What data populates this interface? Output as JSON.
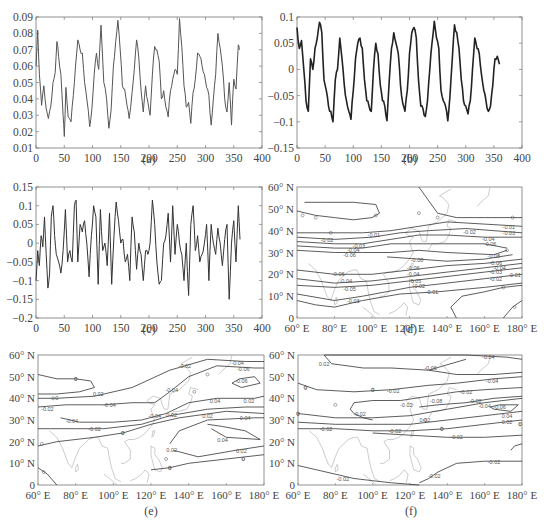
{
  "figure": {
    "panels": [
      "(a)",
      "(b)",
      "(c)",
      "(d)",
      "(e)",
      "(f)"
    ]
  },
  "chart_data": [
    {
      "id": "a",
      "type": "line",
      "caption": "(a)",
      "xlabel": "",
      "ylabel": "",
      "xlim": [
        0,
        400
      ],
      "ylim": [
        0.01,
        0.09
      ],
      "xticks": [
        0,
        50,
        100,
        150,
        200,
        250,
        300,
        350,
        400
      ],
      "yticks": [
        0.01,
        0.02,
        0.03,
        0.04,
        0.05,
        0.06,
        0.07,
        0.08,
        0.09
      ],
      "ytick_labels": [
        "0.01",
        "0.02",
        "0.03",
        "0.04",
        "0.05",
        "0.06",
        "0.07",
        "0.08",
        "0.09"
      ],
      "series": [
        {
          "name": "a",
          "color": "#555555",
          "x": [
            0,
            3,
            6,
            10,
            14,
            18,
            22,
            26,
            30,
            34,
            37,
            40,
            44,
            48,
            50,
            53,
            57,
            62,
            66,
            70,
            74,
            78,
            82,
            86,
            90,
            95,
            99,
            103,
            107,
            111,
            115,
            120,
            125,
            129,
            133,
            137,
            141,
            145,
            149,
            153,
            157,
            161,
            165,
            170,
            174,
            178,
            182,
            186,
            190,
            194,
            198,
            202,
            206,
            210,
            214,
            218,
            222,
            226,
            230,
            234,
            238,
            242,
            246,
            250,
            254,
            258,
            262,
            266,
            270,
            274,
            278,
            282,
            286,
            290,
            294,
            298,
            302,
            306,
            310,
            314,
            318,
            322,
            326,
            330,
            334,
            338,
            342,
            346,
            350,
            354,
            358,
            360
          ],
          "y": [
            0.06,
            0.082,
            0.055,
            0.036,
            0.048,
            0.034,
            0.028,
            0.035,
            0.05,
            0.056,
            0.075,
            0.066,
            0.055,
            0.03,
            0.017,
            0.047,
            0.029,
            0.026,
            0.042,
            0.06,
            0.076,
            0.07,
            0.068,
            0.05,
            0.04,
            0.023,
            0.034,
            0.055,
            0.068,
            0.058,
            0.085,
            0.05,
            0.04,
            0.022,
            0.033,
            0.06,
            0.075,
            0.088,
            0.07,
            0.048,
            0.046,
            0.036,
            0.028,
            0.044,
            0.058,
            0.076,
            0.065,
            0.045,
            0.032,
            0.048,
            0.038,
            0.03,
            0.055,
            0.072,
            0.07,
            0.063,
            0.04,
            0.045,
            0.035,
            0.029,
            0.045,
            0.052,
            0.058,
            0.055,
            0.089,
            0.072,
            0.048,
            0.035,
            0.038,
            0.025,
            0.044,
            0.052,
            0.068,
            0.066,
            0.06,
            0.055,
            0.047,
            0.042,
            0.024,
            0.04,
            0.055,
            0.08,
            0.071,
            0.06,
            0.04,
            0.032,
            0.05,
            0.024,
            0.052,
            0.046,
            0.073,
            0.07
          ]
        }
      ]
    },
    {
      "id": "b",
      "type": "line",
      "caption": "(b)",
      "xlabel": "",
      "ylabel": "",
      "xlim": [
        0,
        400
      ],
      "ylim": [
        -0.15,
        0.1
      ],
      "xticks": [
        0,
        50,
        100,
        150,
        200,
        250,
        300,
        350,
        400
      ],
      "yticks": [
        -0.15,
        -0.1,
        -0.05,
        0,
        0.05,
        0.1
      ],
      "ytick_labels": [
        "-0.15",
        "-0.1",
        "-0.05",
        "0",
        "0.05",
        "0.1"
      ],
      "series": [
        {
          "name": "b",
          "color": "#222222",
          "x": [
            0,
            4,
            8,
            12,
            16,
            20,
            24,
            28,
            32,
            36,
            40,
            44,
            48,
            52,
            56,
            60,
            64,
            68,
            72,
            76,
            80,
            84,
            88,
            92,
            96,
            100,
            104,
            108,
            112,
            116,
            120,
            124,
            128,
            132,
            136,
            140,
            144,
            148,
            152,
            156,
            160,
            164,
            168,
            172,
            176,
            180,
            184,
            188,
            192,
            196,
            200,
            204,
            208,
            212,
            216,
            220,
            224,
            228,
            232,
            236,
            240,
            244,
            248,
            252,
            256,
            260,
            264,
            268,
            272,
            276,
            280,
            284,
            288,
            292,
            296,
            300,
            304,
            308,
            312,
            316,
            320,
            324,
            328,
            332,
            336,
            340,
            344,
            348,
            352,
            356,
            360
          ],
          "y": [
            0.08,
            0.04,
            0.055,
            0.0,
            -0.06,
            -0.08,
            0.02,
            0.0,
            0.04,
            0.06,
            0.09,
            0.07,
            -0.02,
            -0.04,
            -0.07,
            -0.08,
            -0.1,
            -0.02,
            0.0,
            0.06,
            0.02,
            -0.03,
            -0.06,
            -0.08,
            -0.095,
            -0.04,
            0.02,
            0.05,
            0.06,
            0.04,
            -0.02,
            -0.06,
            -0.07,
            -0.08,
            0.0,
            0.05,
            0.03,
            -0.03,
            -0.06,
            -0.07,
            -0.098,
            -0.02,
            0.04,
            0.07,
            0.05,
            0.03,
            -0.03,
            -0.065,
            -0.08,
            -0.04,
            0.03,
            0.07,
            0.08,
            0.06,
            -0.02,
            -0.07,
            -0.075,
            -0.09,
            -0.06,
            0.0,
            0.05,
            0.092,
            0.06,
            0.04,
            -0.04,
            -0.06,
            -0.07,
            -0.098,
            -0.05,
            0.02,
            0.085,
            0.07,
            0.04,
            -0.02,
            -0.06,
            -0.07,
            -0.085,
            -0.06,
            0.0,
            0.06,
            0.04,
            0.03,
            -0.01,
            -0.04,
            -0.06,
            -0.08,
            -0.07,
            -0.03,
            0.02,
            0.025,
            0.01
          ]
        }
      ]
    },
    {
      "id": "c",
      "type": "line",
      "caption": "(c)",
      "xlabel": "",
      "ylabel": "",
      "xlim": [
        0,
        400
      ],
      "ylim": [
        -0.2,
        0.15
      ],
      "xticks": [
        0,
        50,
        100,
        150,
        200,
        250,
        300,
        350,
        400
      ],
      "yticks": [
        -0.2,
        -0.15,
        -0.1,
        -0.05,
        0,
        0.05,
        0.1,
        0.15
      ],
      "ytick_labels": [
        "-0.2",
        "-0.15",
        "-0.1",
        "-0.05",
        "0",
        "0.05",
        "0.1",
        "0.15"
      ],
      "series": [
        {
          "name": "c",
          "color": "#333333",
          "x": [
            0,
            3,
            6,
            9,
            12,
            15,
            18,
            21,
            24,
            27,
            30,
            33,
            36,
            40,
            44,
            48,
            52,
            56,
            60,
            64,
            68,
            71,
            74,
            78,
            82,
            86,
            90,
            94,
            98,
            102,
            106,
            110,
            114,
            118,
            122,
            126,
            130,
            134,
            138,
            142,
            146,
            150,
            154,
            158,
            162,
            166,
            170,
            174,
            178,
            182,
            186,
            190,
            194,
            198,
            202,
            206,
            210,
            214,
            218,
            222,
            226,
            230,
            234,
            238,
            242,
            246,
            250,
            254,
            258,
            262,
            266,
            270,
            274,
            278,
            282,
            286,
            290,
            294,
            298,
            302,
            306,
            310,
            314,
            318,
            322,
            326,
            330,
            334,
            338,
            342,
            346,
            350,
            354,
            358,
            361
          ],
          "y": [
            -0.1,
            -0.02,
            -0.06,
            0.02,
            -0.01,
            0.07,
            -0.03,
            -0.12,
            -0.08,
            0.07,
            0.1,
            0.02,
            -0.03,
            -0.05,
            -0.08,
            -0.02,
            0.09,
            -0.05,
            -0.02,
            -0.05,
            0.1,
            0.115,
            -0.05,
            0.05,
            0.03,
            0.06,
            0.0,
            -0.09,
            0.02,
            0.1,
            0.07,
            -0.11,
            0.09,
            -0.02,
            0.0,
            -0.06,
            0.08,
            -0.11,
            0.02,
            0.11,
            0.06,
            0.0,
            0.01,
            -0.05,
            -0.03,
            -0.1,
            0.07,
            0.03,
            -0.07,
            0.0,
            -0.03,
            -0.1,
            -0.02,
            -0.03,
            0.0,
            0.115,
            0.05,
            -0.05,
            -0.11,
            -0.1,
            0.0,
            0.02,
            0.08,
            -0.05,
            0.1,
            -0.03,
            0.05,
            0.0,
            -0.03,
            -0.1,
            0.0,
            -0.14,
            0.05,
            0.1,
            -0.02,
            0.02,
            -0.05,
            -0.03,
            0.0,
            0.05,
            -0.1,
            0.05,
            0.0,
            -0.03,
            0.04,
            0.0,
            -0.06,
            0.01,
            0.05,
            -0.15,
            0.0,
            0.06,
            -0.05,
            0.1,
            0.01
          ]
        }
      ]
    },
    {
      "id": "d",
      "type": "contour-map",
      "caption": "(d)",
      "region": "East Asia / Western Pacific",
      "xlim": [
        60,
        180
      ],
      "ylim": [
        0,
        60
      ],
      "xtick_labels": [
        "60° E",
        "80° E",
        "100° E",
        "120° E",
        "140° E",
        "160° E",
        "180° E"
      ],
      "ytick_labels": [
        "0",
        "10° N",
        "20° N",
        "30° N",
        "40° N",
        "50° N",
        "60° N"
      ],
      "contour_labels": [
        "0.01",
        "0.02",
        "0.03",
        "0.04",
        "0.05",
        "0.06",
        "0.08",
        "0.09",
        "0.08",
        "0.05",
        "0.04",
        "0.03",
        "0.02",
        "0.01",
        "-0.01"
      ]
    },
    {
      "id": "e",
      "type": "contour-map",
      "caption": "(e)",
      "region": "East Asia / Western Pacific",
      "xlim": [
        60,
        180
      ],
      "ylim": [
        0,
        60
      ],
      "xtick_labels": [
        "60° E",
        "80° E",
        "100° E",
        "120° E",
        "140° E",
        "160° E",
        "180° E"
      ],
      "ytick_labels": [
        "0",
        "10° N",
        "20° N",
        "30° N",
        "40° N",
        "50° N",
        "60° N"
      ],
      "contour_labels": [
        "0.02",
        "-0.02",
        "-0.04",
        "-0.04",
        "-0.02",
        "0.02",
        "0.04",
        "-0.04",
        "-0.06",
        "-0.06",
        "0.02",
        "0.04",
        "0.02",
        "-0.04",
        "-0.02",
        "0.02",
        "0"
      ]
    },
    {
      "id": "f",
      "type": "contour-map",
      "caption": "(f)",
      "region": "East Asia / Western Pacific",
      "xlim": [
        60,
        180
      ],
      "ylim": [
        0,
        60
      ],
      "xtick_labels": [
        "60° E",
        "80° E",
        "100° E",
        "120° E",
        "140° E",
        "160° E",
        "180° E"
      ],
      "ytick_labels": [
        "0",
        "10° N",
        "20° N",
        "30° N",
        "40° N",
        "50° N",
        "60° N"
      ],
      "contour_labels": [
        "0.02",
        "-0.02",
        "0.02",
        "-0.02",
        "-0.02",
        "0.02",
        "0.04",
        "0.06",
        "-0.04",
        "-0.08",
        "0.02",
        "0.04",
        "0.06",
        "0.04",
        "-0.02",
        "-0.02",
        "-0.02"
      ]
    }
  ]
}
